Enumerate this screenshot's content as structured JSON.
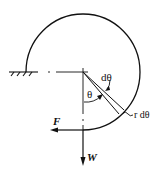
{
  "diagram": {
    "labels": {
      "d_theta": "dθ",
      "theta": "θ",
      "r_d_theta": "r dθ",
      "force_F": "F",
      "weight_W": "W"
    },
    "colors": {
      "ink": "#111111",
      "background": "#ffffff"
    }
  }
}
